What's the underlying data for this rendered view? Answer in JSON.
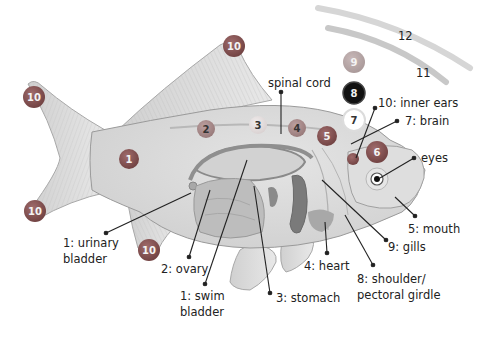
{
  "diagram": {
    "colors": {
      "body": "#d9d9d9",
      "body_outline": "#9a9a9a",
      "fin": "#e2e2e2",
      "organ_dark": "#7d7d7d",
      "marker_red": "#8e5a5a",
      "marker_dark_red": "#6e3a3a",
      "marker_black": "#111111",
      "marker_light": "#bdbdbd",
      "leader_line": "#222222",
      "text": "#222222"
    },
    "labels": {
      "spinal_cord": "spinal cord",
      "inner_ears": "10: inner ears",
      "brain": "7: brain",
      "eyes": "eyes",
      "mouth": "5: mouth",
      "gills": "9: gills",
      "shoulder_line1": "8: shoulder/",
      "shoulder_line2": "pectoral girdle",
      "heart": "4: heart",
      "stomach": "3: stomach",
      "swim_line1": "1: swim",
      "swim_line2": "bladder",
      "ovary": "2: ovary",
      "urinary_line1": "1: urinary",
      "urinary_line2": "bladder"
    },
    "markers": [
      {
        "id": "tail-top",
        "number": "10",
        "style": "red"
      },
      {
        "id": "tail-bottom",
        "number": "10",
        "style": "red"
      },
      {
        "id": "dorsal-fin",
        "number": "10",
        "style": "red"
      },
      {
        "id": "pelvic-fin",
        "number": "10",
        "style": "red"
      },
      {
        "id": "body-1",
        "number": "1",
        "style": "red"
      },
      {
        "id": "body-2",
        "number": "2",
        "style": "light-red"
      },
      {
        "id": "body-3",
        "number": "3",
        "style": "pale"
      },
      {
        "id": "body-4",
        "number": "4",
        "style": "light-red"
      },
      {
        "id": "body-5",
        "number": "5",
        "style": "red"
      },
      {
        "id": "body-6",
        "number": "6",
        "style": "red"
      },
      {
        "id": "column-9",
        "number": "9",
        "style": "grey"
      },
      {
        "id": "column-8",
        "number": "8",
        "style": "black"
      },
      {
        "id": "column-7",
        "number": "7",
        "style": "white"
      }
    ],
    "arc_labels": {
      "outer": "12",
      "inner": "11"
    }
  }
}
